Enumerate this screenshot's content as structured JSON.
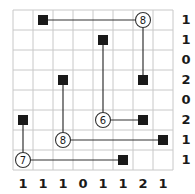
{
  "puzzle": {
    "rows": 8,
    "cols": 8,
    "grid_origin": [
      13,
      10
    ],
    "cell_size": 20,
    "colors": {
      "grid": "#c8c8c8",
      "ink": "#1a1a1a",
      "background": "#ffffff"
    },
    "circles": [
      {
        "row": 0,
        "col": 6,
        "value": "8"
      },
      {
        "row": 5,
        "col": 4,
        "value": "6"
      },
      {
        "row": 6,
        "col": 2,
        "value": "8"
      },
      {
        "row": 7,
        "col": 0,
        "value": "7"
      }
    ],
    "squares": [
      {
        "row": 0,
        "col": 1
      },
      {
        "row": 1,
        "col": 4
      },
      {
        "row": 3,
        "col": 2
      },
      {
        "row": 3,
        "col": 6
      },
      {
        "row": 5,
        "col": 0
      },
      {
        "row": 5,
        "col": 6
      },
      {
        "row": 6,
        "col": 7
      },
      {
        "row": 7,
        "col": 5
      }
    ],
    "lines": [
      {
        "from": [
          0,
          1
        ],
        "to": [
          0,
          6
        ]
      },
      {
        "from": [
          0,
          6
        ],
        "to": [
          3,
          6
        ]
      },
      {
        "from": [
          1,
          4
        ],
        "to": [
          5,
          4
        ]
      },
      {
        "from": [
          5,
          4
        ],
        "to": [
          5,
          6
        ]
      },
      {
        "from": [
          3,
          2
        ],
        "to": [
          6,
          2
        ]
      },
      {
        "from": [
          6,
          2
        ],
        "to": [
          6,
          7
        ]
      },
      {
        "from": [
          5,
          0
        ],
        "to": [
          7,
          0
        ]
      },
      {
        "from": [
          7,
          0
        ],
        "to": [
          7,
          5
        ]
      }
    ],
    "row_clues": [
      "1",
      "1",
      "0",
      "2",
      "0",
      "2",
      "1",
      "1"
    ],
    "col_clues": [
      "1",
      "1",
      "1",
      "0",
      "1",
      "1",
      "2",
      "1"
    ]
  }
}
